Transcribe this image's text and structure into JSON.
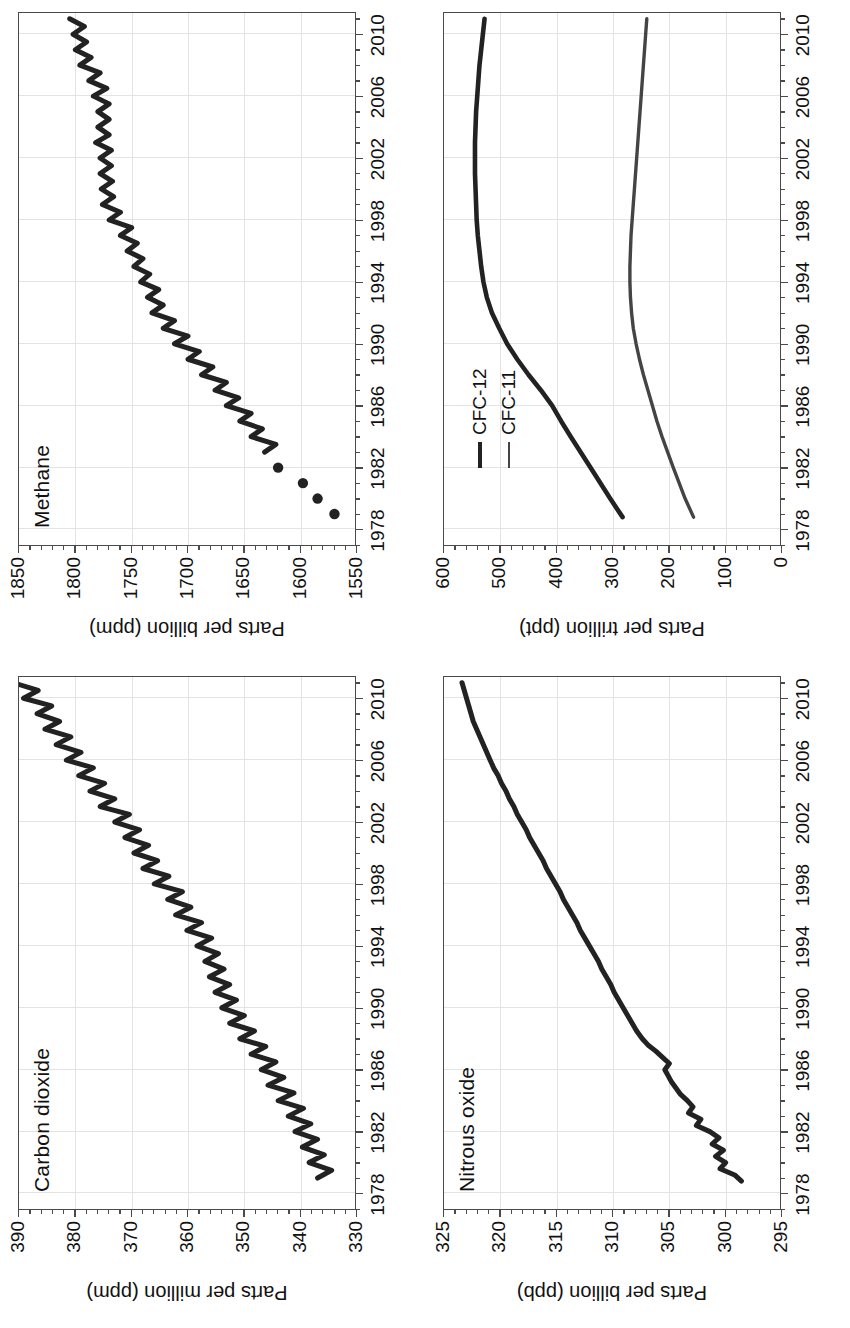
{
  "figure": {
    "orientation": "rotated-90-ccw",
    "panel_count": 4
  },
  "panels": [
    {
      "id": "co2",
      "title": "Carbon dioxide",
      "ylabel": "Parts per million (ppm)",
      "ytick_labels": [
        "330",
        "340",
        "350",
        "360",
        "370",
        "380",
        "390"
      ],
      "xtick_labels": [
        "1978",
        "1982",
        "1986",
        "1990",
        "1994",
        "1998",
        "2002",
        "2006",
        "2010"
      ]
    },
    {
      "id": "ch4",
      "title": "Methane",
      "ylabel": "Parts per billion (ppm)",
      "ytick_labels": [
        "1550",
        "1600",
        "1650",
        "1700",
        "1750",
        "1800",
        "1850"
      ],
      "xtick_labels": [
        "1978",
        "1982",
        "1986",
        "1990",
        "1994",
        "1998",
        "2002",
        "2006",
        "2010"
      ]
    },
    {
      "id": "n2o",
      "title": "Nitrous oxide",
      "ylabel": "Parts per billion (ppb)",
      "ytick_labels": [
        "295",
        "300",
        "305",
        "310",
        "315",
        "320",
        "325"
      ],
      "xtick_labels": [
        "1978",
        "1982",
        "1986",
        "1990",
        "1994",
        "1998",
        "2002",
        "2006",
        "2010"
      ]
    },
    {
      "id": "cfc",
      "title": "",
      "ylabel": "Parts per trillion (ppt)",
      "ytick_labels": [
        "0",
        "100",
        "200",
        "300",
        "400",
        "500",
        "600"
      ],
      "xtick_labels": [
        "1978",
        "1982",
        "1986",
        "1990",
        "1994",
        "1998",
        "2002",
        "2006",
        "2010"
      ],
      "legend": [
        {
          "label": "CFC-12",
          "color": "#222222",
          "weight": "thick"
        },
        {
          "label": "CFC-11",
          "color": "#444444",
          "weight": "thin"
        }
      ]
    }
  ],
  "colors": {
    "line": "#222222",
    "line_secondary": "#444444",
    "frame": "#4a4a4a",
    "grid": "#e3e3e3",
    "background": "#ffffff"
  },
  "chart_data": [
    {
      "type": "line",
      "id": "co2",
      "title": "Carbon dioxide",
      "xlabel": "",
      "ylabel": "Parts per million (ppm)",
      "xlim": [
        1977.0,
        2011.5
      ],
      "ylim": [
        330,
        390
      ],
      "xticks": [
        1978,
        1982,
        1986,
        1990,
        1994,
        1998,
        2002,
        2006,
        2010
      ],
      "yticks": [
        330,
        340,
        350,
        360,
        370,
        380,
        390
      ],
      "grid": true,
      "legend": "none",
      "note": "monthly mean with strong seasonal cycle (~6 ppm peak-to-peak)",
      "series": [
        {
          "name": "CO2",
          "x": [
            1979.0,
            1979.5,
            1980.0,
            1980.5,
            1981.0,
            1981.5,
            1982.0,
            1982.5,
            1983.0,
            1983.5,
            1984.0,
            1984.5,
            1985.0,
            1985.5,
            1986.0,
            1986.5,
            1987.0,
            1987.5,
            1988.0,
            1988.5,
            1989.0,
            1989.5,
            1990.0,
            1990.5,
            1991.0,
            1991.5,
            1992.0,
            1992.5,
            1993.0,
            1993.5,
            1994.0,
            1994.5,
            1995.0,
            1995.5,
            1996.0,
            1996.5,
            1997.0,
            1997.5,
            1998.0,
            1998.5,
            1999.0,
            1999.5,
            2000.0,
            2000.5,
            2001.0,
            2001.5,
            2002.0,
            2002.5,
            2003.0,
            2003.5,
            2004.0,
            2004.5,
            2005.0,
            2005.5,
            2006.0,
            2006.5,
            2007.0,
            2007.5,
            2008.0,
            2008.5,
            2009.0,
            2009.5,
            2010.0,
            2010.5,
            2011.0
          ],
          "y": [
            337.0,
            334.5,
            338.5,
            335.8,
            339.7,
            337.0,
            341.0,
            338.2,
            342.2,
            339.5,
            344.0,
            341.2,
            345.8,
            343.0,
            347.0,
            344.4,
            348.8,
            346.2,
            350.8,
            348.2,
            352.6,
            350.0,
            354.0,
            351.4,
            355.2,
            352.6,
            356.2,
            353.6,
            357.0,
            354.6,
            358.4,
            355.8,
            360.2,
            357.6,
            362.2,
            359.5,
            363.6,
            361.0,
            366.0,
            363.4,
            368.0,
            365.4,
            369.6,
            367.0,
            371.2,
            368.6,
            373.0,
            370.4,
            375.6,
            373.0,
            377.4,
            374.8,
            379.4,
            376.8,
            381.6,
            379.0,
            383.4,
            380.8,
            385.4,
            382.8,
            386.8,
            384.2,
            389.2,
            386.6,
            391.0
          ]
        }
      ]
    },
    {
      "type": "line",
      "id": "ch4",
      "title": "Methane",
      "xlabel": "",
      "ylabel": "Parts per billion (ppm)",
      "xlim": [
        1977.0,
        2011.5
      ],
      "ylim": [
        1550,
        1850
      ],
      "xticks": [
        1978,
        1982,
        1986,
        1990,
        1994,
        1998,
        2002,
        2006,
        2010
      ],
      "yticks": [
        1550,
        1600,
        1650,
        1700,
        1750,
        1800,
        1850
      ],
      "grid": true,
      "legend": "none",
      "note": "four discrete annual points 1979-1982, then continuous monthly record with seasonal cycle; growth flattens after ~1999",
      "series": [
        {
          "name": "CH4-early-points",
          "marker": "filled-circle",
          "x": [
            1979.0,
            1980.0,
            1981.0,
            1982.0
          ],
          "y": [
            1570,
            1585,
            1598,
            1620
          ]
        },
        {
          "name": "CH4",
          "x": [
            1983.0,
            1983.5,
            1984.0,
            1984.5,
            1985.0,
            1985.5,
            1986.0,
            1986.5,
            1987.0,
            1987.5,
            1988.0,
            1988.5,
            1989.0,
            1989.5,
            1990.0,
            1990.5,
            1991.0,
            1991.5,
            1992.0,
            1992.5,
            1993.0,
            1993.5,
            1994.0,
            1994.5,
            1995.0,
            1995.5,
            1996.0,
            1996.5,
            1997.0,
            1997.5,
            1998.0,
            1998.5,
            1999.0,
            1999.5,
            2000.0,
            2000.5,
            2001.0,
            2001.5,
            2002.0,
            2002.5,
            2003.0,
            2003.5,
            2004.0,
            2004.5,
            2005.0,
            2005.5,
            2006.0,
            2006.5,
            2007.0,
            2007.5,
            2008.0,
            2008.5,
            2009.0,
            2009.5,
            2010.0,
            2010.5,
            2011.0
          ],
          "y": [
            1632,
            1622,
            1644,
            1634,
            1654,
            1644,
            1666,
            1655,
            1676,
            1666,
            1688,
            1678,
            1700,
            1690,
            1712,
            1700,
            1722,
            1712,
            1732,
            1722,
            1736,
            1726,
            1742,
            1734,
            1748,
            1740,
            1754,
            1745,
            1760,
            1750,
            1770,
            1760,
            1776,
            1766,
            1777,
            1767,
            1778,
            1768,
            1778,
            1768,
            1782,
            1770,
            1780,
            1770,
            1780,
            1770,
            1784,
            1772,
            1788,
            1778,
            1796,
            1786,
            1800,
            1790,
            1802,
            1792,
            1805
          ]
        }
      ]
    },
    {
      "type": "line",
      "id": "n2o",
      "title": "Nitrous oxide",
      "xlabel": "",
      "ylabel": "Parts per billion (ppb)",
      "xlim": [
        1977.0,
        2011.5
      ],
      "ylim": [
        295,
        325
      ],
      "xticks": [
        1978,
        1982,
        1986,
        1990,
        1994,
        1998,
        2002,
        2006,
        2010
      ],
      "yticks": [
        295,
        300,
        305,
        310,
        315,
        320,
        325
      ],
      "grid": true,
      "legend": "none",
      "note": "near-linear rise; noisy instrument record before ~1988",
      "series": [
        {
          "name": "N2O",
          "x": [
            1978.8,
            1979.2,
            1979.6,
            1980.0,
            1980.4,
            1980.8,
            1981.2,
            1981.6,
            1982.0,
            1982.4,
            1982.8,
            1983.2,
            1983.6,
            1984.0,
            1984.4,
            1984.8,
            1985.2,
            1985.6,
            1986.0,
            1986.4,
            1986.8,
            1987.2,
            1987.6,
            1988.0,
            1988.5,
            1989.0,
            1989.5,
            1990.0,
            1990.5,
            1991.0,
            1991.5,
            1992.0,
            1992.5,
            1993.0,
            1993.5,
            1994.0,
            1994.5,
            1995.0,
            1995.5,
            1996.0,
            1996.5,
            1997.0,
            1997.5,
            1998.0,
            1998.5,
            1999.0,
            1999.5,
            2000.0,
            2000.5,
            2001.0,
            2001.5,
            2002.0,
            2002.5,
            2003.0,
            2003.5,
            2004.0,
            2004.5,
            2005.0,
            2005.5,
            2006.0,
            2006.5,
            2007.0,
            2007.5,
            2008.0,
            2008.5,
            2009.0,
            2009.5,
            2010.0,
            2010.5,
            2011.0
          ],
          "y": [
            298.6,
            299.2,
            300.5,
            300.0,
            300.9,
            300.2,
            301.2,
            300.6,
            301.4,
            302.6,
            302.2,
            303.3,
            302.9,
            303.4,
            304.0,
            304.4,
            304.8,
            305.1,
            305.4,
            305.0,
            305.6,
            306.2,
            306.9,
            307.4,
            307.9,
            308.3,
            308.7,
            309.1,
            309.5,
            309.9,
            310.2,
            310.6,
            311.0,
            311.3,
            311.7,
            312.1,
            312.5,
            312.9,
            313.2,
            313.6,
            314.0,
            314.4,
            314.7,
            315.1,
            315.5,
            315.9,
            316.2,
            316.6,
            317.0,
            317.4,
            317.7,
            318.1,
            318.5,
            318.8,
            319.2,
            319.5,
            319.9,
            320.2,
            320.6,
            320.9,
            321.2,
            321.5,
            321.8,
            322.1,
            322.4,
            322.6,
            322.8,
            323.0,
            323.2,
            323.4
          ]
        }
      ]
    },
    {
      "type": "line",
      "id": "cfc",
      "title": "",
      "xlabel": "",
      "ylabel": "Parts per trillion (ppt)",
      "xlim": [
        1977.0,
        2011.5
      ],
      "ylim": [
        0,
        600
      ],
      "xticks": [
        1978,
        1982,
        1986,
        1990,
        1994,
        1998,
        2002,
        2006,
        2010
      ],
      "yticks": [
        0,
        100,
        200,
        300,
        400,
        500,
        600
      ],
      "grid": true,
      "legend": "upper-left",
      "note": "CFC-12 rises to ~545 ppt peak ~2003 then slowly declines; CFC-11 peaks ~270 ppt ~1994 then declines to ~240 ppt",
      "series": [
        {
          "name": "CFC-12",
          "color": "#222222",
          "x": [
            1978.8,
            1980,
            1982,
            1984,
            1985,
            1986,
            1987,
            1988,
            1989,
            1990,
            1991,
            1992,
            1993,
            1994,
            1995,
            1996,
            1997,
            1998,
            1999,
            2000,
            2001,
            2002,
            2003,
            2004,
            2005,
            2006,
            2007,
            2008,
            2009,
            2010,
            2011
          ],
          "y": [
            283,
            305,
            340,
            375,
            392,
            408,
            428,
            450,
            470,
            488,
            502,
            515,
            524,
            530,
            534,
            537,
            540,
            542,
            543,
            544,
            545,
            545,
            545,
            544,
            543,
            541,
            539,
            537,
            534,
            531,
            528
          ]
        },
        {
          "name": "CFC-11",
          "color": "#444444",
          "x": [
            1978.8,
            1980,
            1982,
            1984,
            1985,
            1986,
            1987,
            1988,
            1989,
            1990,
            1991,
            1992,
            1993,
            1994,
            1995,
            1996,
            1997,
            1998,
            1999,
            2000,
            2001,
            2002,
            2003,
            2004,
            2005,
            2006,
            2007,
            2008,
            2009,
            2010,
            2011
          ],
          "y": [
            157,
            172,
            193,
            213,
            222,
            230,
            238,
            246,
            253,
            259,
            264,
            267,
            269,
            270,
            270,
            269,
            268,
            266,
            264,
            262,
            260,
            258,
            256,
            254,
            252,
            250,
            248,
            246,
            244,
            242,
            240
          ]
        }
      ]
    }
  ]
}
